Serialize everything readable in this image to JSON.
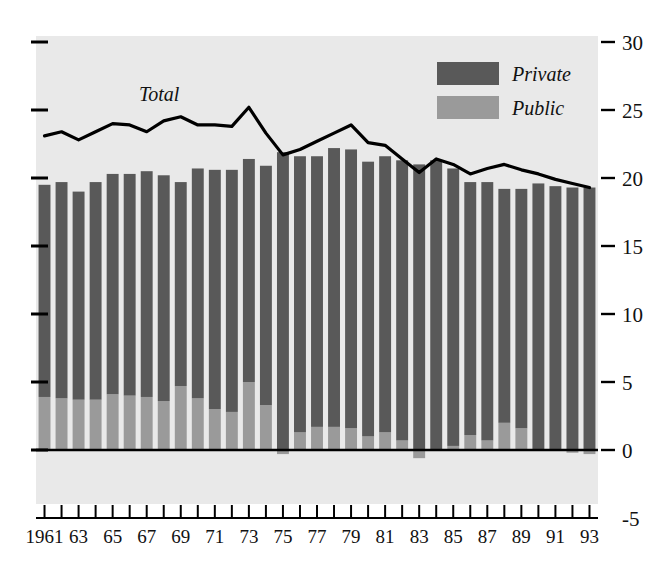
{
  "chart_data": {
    "type": "bar",
    "subtype": "stacked-bar-with-line-overlay",
    "title": "",
    "subtitle": "",
    "xlabel": "",
    "ylabel": "",
    "grid": false,
    "ylim": [
      -5,
      30
    ],
    "yticks": [
      -5,
      0,
      5,
      10,
      15,
      20,
      25,
      30
    ],
    "ytick_labels": [
      "-5",
      "0",
      "5",
      "10",
      "15",
      "20",
      "25",
      "30"
    ],
    "xlim": [
      1961,
      1993
    ],
    "xticks": [
      1961,
      1962,
      1963,
      1964,
      1965,
      1966,
      1967,
      1968,
      1969,
      1970,
      1971,
      1972,
      1973,
      1974,
      1975,
      1976,
      1977,
      1978,
      1979,
      1980,
      1981,
      1982,
      1983,
      1984,
      1985,
      1986,
      1987,
      1988,
      1989,
      1990,
      1991,
      1992,
      1993
    ],
    "xtick_labels": [
      "1961",
      "",
      "63",
      "",
      "65",
      "",
      "67",
      "",
      "69",
      "",
      "71",
      "",
      "73",
      "",
      "75",
      "",
      "77",
      "",
      "79",
      "",
      "81",
      "",
      "83",
      "",
      "85",
      "",
      "87",
      "",
      "89",
      "",
      "91",
      "",
      "93"
    ],
    "legend_position": "top-right",
    "categories": [
      1961,
      1962,
      1963,
      1964,
      1965,
      1966,
      1967,
      1968,
      1969,
      1970,
      1971,
      1972,
      1973,
      1974,
      1975,
      1976,
      1977,
      1978,
      1979,
      1980,
      1981,
      1982,
      1983,
      1984,
      1985,
      1986,
      1987,
      1988,
      1989,
      1990,
      1991,
      1992,
      1993
    ],
    "series": [
      {
        "name": "Private",
        "color": "#595959",
        "stack": "bars",
        "values": [
          15.6,
          15.9,
          15.3,
          16.0,
          16.2,
          16.3,
          16.6,
          16.6,
          15.0,
          16.9,
          17.6,
          17.8,
          16.4,
          17.6,
          21.9,
          20.3,
          19.9,
          20.5,
          20.5,
          20.2,
          20.3,
          20.6,
          21.0,
          21.3,
          20.4,
          18.6,
          19.0,
          17.2,
          17.6,
          19.6,
          19.4,
          19.3,
          19.3
        ]
      },
      {
        "name": "Public",
        "color": "#9a9a9a",
        "stack": "bars",
        "values": [
          3.9,
          3.8,
          3.7,
          3.7,
          4.1,
          4.0,
          3.9,
          3.6,
          4.7,
          3.8,
          3.0,
          2.8,
          5.0,
          3.3,
          -0.3,
          1.3,
          1.7,
          1.7,
          1.6,
          1.0,
          1.3,
          0.7,
          -0.6,
          0.0,
          0.3,
          1.1,
          0.7,
          2.0,
          1.6,
          0.0,
          0.0,
          -0.2,
          -0.3
        ]
      },
      {
        "name": "Total",
        "color": "#000000",
        "type": "line",
        "values": [
          23.1,
          23.4,
          22.8,
          23.4,
          24.0,
          23.9,
          23.4,
          24.2,
          24.5,
          23.9,
          23.9,
          23.8,
          25.2,
          23.3,
          21.7,
          22.1,
          22.7,
          23.3,
          23.9,
          22.6,
          22.4,
          21.4,
          20.4,
          21.4,
          21.0,
          20.3,
          20.7,
          21.0,
          20.6,
          20.3,
          19.9,
          19.6,
          19.3
        ]
      }
    ]
  },
  "legend": {
    "items": [
      {
        "label": "Private",
        "color": "#595959"
      },
      {
        "label": "Public",
        "color": "#9a9a9a"
      }
    ]
  },
  "annotations": {
    "total_label": "Total"
  },
  "colors": {
    "plot_background": "#e9e9e9",
    "page_background": "#ffffff",
    "private": "#595959",
    "public": "#9a9a9a",
    "line": "#000000",
    "axis": "#000000",
    "text": "#111111"
  }
}
